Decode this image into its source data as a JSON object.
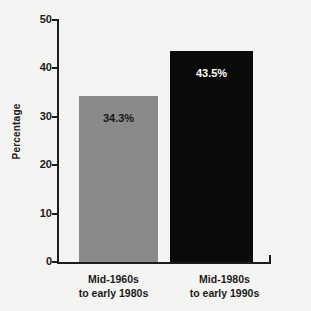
{
  "chart_data": {
    "type": "bar",
    "title": "",
    "xlabel": "",
    "ylabel": "Percentage",
    "ylim": [
      0,
      50
    ],
    "yticks": [
      0,
      10,
      20,
      30,
      40,
      50
    ],
    "ytick_labels": [
      "0",
      "10",
      "20",
      "30",
      "40",
      "50"
    ],
    "grid": false,
    "legend": "none",
    "categories": [
      "Mid-1960s to early 1980s",
      "Mid-1980s to early 1990s"
    ],
    "category_lines": [
      [
        "Mid-1960s",
        "to early 1980s"
      ],
      [
        "Mid-1980s",
        "to early 1990s"
      ]
    ],
    "values": [
      34.3,
      43.5
    ],
    "value_labels": [
      "34.3%",
      "43.5%"
    ],
    "bar_colors": [
      "#8a8a8a",
      "#0a0a0a"
    ],
    "value_label_colors": [
      "#161616",
      "#ffffff"
    ],
    "background_color": "#f4f4f2",
    "axis_color": "#1c1c1c"
  }
}
